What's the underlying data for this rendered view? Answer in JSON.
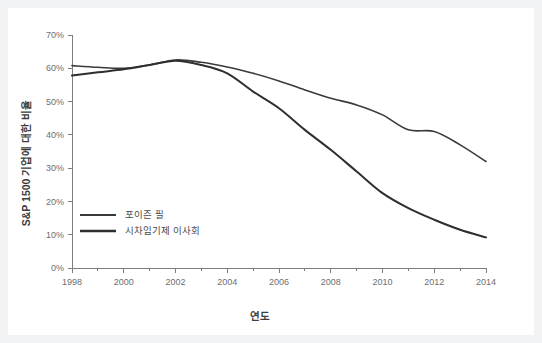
{
  "chart_data": {
    "type": "line",
    "title": "",
    "xlabel": "연도",
    "ylabel": "S&P 1500 기업에 대한 비율",
    "xlim": [
      1998,
      2014
    ],
    "ylim": [
      0,
      70
    ],
    "grid": false,
    "legend_position": "inside-bottom-left",
    "x": [
      1998,
      1999,
      2000,
      2001,
      2002,
      2003,
      2004,
      2005,
      2006,
      2007,
      2008,
      2009,
      2010,
      2011,
      2012,
      2013,
      2014
    ],
    "xticks": [
      "1998",
      "2000",
      "2002",
      "2004",
      "2006",
      "2008",
      "2010",
      "2012",
      "2014"
    ],
    "xtick_values": [
      1998,
      2000,
      2002,
      2004,
      2006,
      2008,
      2010,
      2012,
      2014
    ],
    "yticks": [
      "0%",
      "10%",
      "20%",
      "30%",
      "40%",
      "50%",
      "60%",
      "70%"
    ],
    "ytick_values": [
      0,
      10,
      20,
      30,
      40,
      50,
      60,
      70
    ],
    "series": [
      {
        "name": "포이즌 필",
        "color": "#3a3a3c",
        "width": 1.6,
        "values": [
          60.8,
          60.3,
          60.0,
          61.0,
          62.5,
          61.8,
          60.4,
          58.5,
          56.2,
          53.5,
          51.0,
          49.0,
          46.0,
          41.5,
          41.0,
          37.0,
          32.0
        ]
      },
      {
        "name": "시차임기제 이사회",
        "color": "#2f2f31",
        "width": 2.0,
        "values": [
          57.8,
          58.8,
          59.7,
          61.0,
          62.3,
          61.0,
          58.5,
          53.0,
          48.0,
          41.5,
          35.5,
          29.0,
          22.5,
          18.0,
          14.5,
          11.5,
          9.2
        ]
      }
    ]
  },
  "legend": {
    "items": [
      {
        "label": "포이즌 필"
      },
      {
        "label": "시차임기제 이사회"
      }
    ]
  },
  "axes": {
    "x_title": "연도",
    "y_title": "S&P 1500 기업에 대한 비율"
  }
}
